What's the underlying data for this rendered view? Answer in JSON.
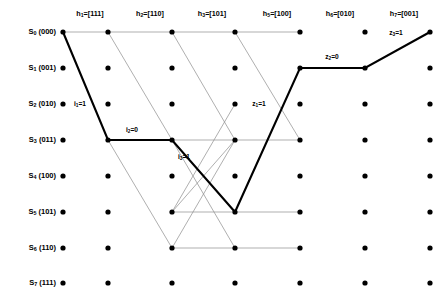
{
  "figure": {
    "type": "trellis-diagram",
    "width": 443,
    "height": 305,
    "background": "#ffffff",
    "node_color": "#000000",
    "thin_edge_color": "#8c8c8c",
    "bold_edge_color": "#000000"
  },
  "states": [
    {
      "id": "S0",
      "index": "0",
      "name": "S",
      "bits": "(000)",
      "row": 0,
      "y": 32
    },
    {
      "id": "S1",
      "index": "1",
      "name": "S",
      "bits": "(001)",
      "row": 1,
      "y": 68
    },
    {
      "id": "S2",
      "index": "2",
      "name": "S",
      "bits": "(010)",
      "row": 2,
      "y": 104
    },
    {
      "id": "S3",
      "index": "3",
      "name": "S",
      "bits": "(011)",
      "row": 3,
      "y": 140
    },
    {
      "id": "S4",
      "index": "4",
      "name": "S",
      "bits": "(100)",
      "row": 4,
      "y": 176
    },
    {
      "id": "S5",
      "index": "5",
      "name": "S",
      "bits": "(101)",
      "row": 5,
      "y": 212
    },
    {
      "id": "S6",
      "index": "6",
      "name": "S",
      "bits": "(110)",
      "row": 6,
      "y": 248
    },
    {
      "id": "S7",
      "index": "7",
      "name": "S",
      "bits": "(111)",
      "row": 7,
      "y": 283
    }
  ],
  "columns": [
    {
      "col": 0,
      "x": 63,
      "header": null,
      "header_sub": null,
      "header_value": null
    },
    {
      "col": 1,
      "x": 108,
      "header": "h",
      "header_sub": "1",
      "header_value": "=[111]"
    },
    {
      "col": 2,
      "x": 172,
      "header": "h",
      "header_sub": "2",
      "header_value": "=[110]"
    },
    {
      "col": 3,
      "x": 235,
      "header": "h",
      "header_sub": "3",
      "header_value": "=[101]"
    },
    {
      "col": 4,
      "x": 300,
      "header": "h",
      "header_sub": "5",
      "header_value": "=[100]"
    },
    {
      "col": 5,
      "x": 365,
      "header": "h",
      "header_sub": "6",
      "header_value": "=[010]"
    },
    {
      "col": 6,
      "x": 430,
      "header": "h",
      "header_sub": "7",
      "header_value": "=[001]"
    }
  ],
  "header_positions": [
    {
      "x": 90,
      "text": "h",
      "sub": "1",
      "value": "=[111]"
    },
    {
      "x": 150,
      "text": "h",
      "sub": "2",
      "value": "=[110]"
    },
    {
      "x": 212,
      "text": "h",
      "sub": "3",
      "value": "=[101]"
    },
    {
      "x": 277,
      "text": "h",
      "sub": "5",
      "value": "=[100]"
    },
    {
      "x": 340,
      "text": "h",
      "sub": "6",
      "value": "=[010]"
    },
    {
      "x": 404,
      "text": "h",
      "sub": "7",
      "value": "=[001]"
    }
  ],
  "nodes": {
    "radius": 2.6,
    "columns_x": [
      63,
      108,
      172,
      235,
      300,
      365,
      430
    ],
    "rows_y": [
      32,
      68,
      104,
      140,
      176,
      212,
      248,
      283
    ]
  },
  "thin_edges": [
    {
      "x1": 63,
      "y1": 32,
      "x2": 108,
      "y2": 32
    },
    {
      "x1": 108,
      "y1": 32,
      "x2": 172,
      "y2": 32
    },
    {
      "x1": 172,
      "y1": 32,
      "x2": 235,
      "y2": 32
    },
    {
      "x1": 235,
      "y1": 32,
      "x2": 300,
      "y2": 32
    },
    {
      "x1": 108,
      "y1": 32,
      "x2": 172,
      "y2": 140
    },
    {
      "x1": 172,
      "y1": 32,
      "x2": 235,
      "y2": 140
    },
    {
      "x1": 235,
      "y1": 32,
      "x2": 300,
      "y2": 140
    },
    {
      "x1": 108,
      "y1": 140,
      "x2": 172,
      "y2": 140
    },
    {
      "x1": 172,
      "y1": 140,
      "x2": 235,
      "y2": 140
    },
    {
      "x1": 235,
      "y1": 140,
      "x2": 300,
      "y2": 140
    },
    {
      "x1": 108,
      "y1": 140,
      "x2": 172,
      "y2": 248
    },
    {
      "x1": 172,
      "y1": 140,
      "x2": 235,
      "y2": 248
    },
    {
      "x1": 235,
      "y1": 140,
      "x2": 172,
      "y2": 212
    },
    {
      "x1": 172,
      "y1": 212,
      "x2": 235,
      "y2": 212
    },
    {
      "x1": 172,
      "y1": 212,
      "x2": 235,
      "y2": 104
    },
    {
      "x1": 172,
      "y1": 248,
      "x2": 235,
      "y2": 248
    },
    {
      "x1": 172,
      "y1": 248,
      "x2": 235,
      "y2": 140
    },
    {
      "x1": 235,
      "y1": 212,
      "x2": 300,
      "y2": 212
    },
    {
      "x1": 235,
      "y1": 248,
      "x2": 300,
      "y2": 248
    }
  ],
  "bold_path": {
    "points": "63,32 108,140 172,140 235,212 300,68 365,68 430,32",
    "description": "survivor path through trellis"
  },
  "edge_labels": [
    {
      "x": 80,
      "y": 104,
      "text": "i",
      "sub": "1",
      "value": "=1"
    },
    {
      "x": 132,
      "y": 130,
      "text": "i",
      "sub": "2",
      "value": "=0"
    },
    {
      "x": 184,
      "y": 157,
      "text": "i",
      "sub": "3",
      "value": "=1"
    },
    {
      "x": 259,
      "y": 104,
      "text": "z",
      "sub": "1",
      "value": "=1"
    },
    {
      "x": 332,
      "y": 57,
      "text": "z",
      "sub": "2",
      "value": "=0"
    },
    {
      "x": 396,
      "y": 33,
      "text": "z",
      "sub": "3",
      "value": "=1"
    }
  ],
  "chart_data": {
    "type": "diagram",
    "title": "",
    "states_count": 8,
    "stages_count": 7
  }
}
